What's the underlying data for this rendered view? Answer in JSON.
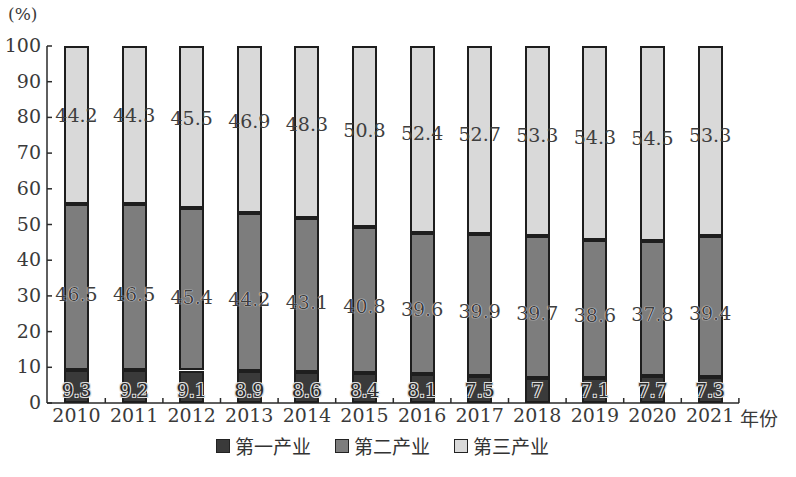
{
  "chart_data": {
    "type": "bar",
    "stacked": true,
    "title": "",
    "ylabel": "(%)",
    "xlabel": "年份",
    "ylim": [
      0,
      100
    ],
    "yticks": [
      0,
      10,
      20,
      30,
      40,
      50,
      60,
      70,
      80,
      90,
      100
    ],
    "grid": false,
    "legend_position": "bottom",
    "categories": [
      "2010",
      "2011",
      "2012",
      "2013",
      "2014",
      "2015",
      "2016",
      "2017",
      "2018",
      "2019",
      "2020",
      "2021"
    ],
    "series": [
      {
        "name": "第一产业",
        "color": "#3a3a3a",
        "values": [
          9.3,
          9.2,
          9.1,
          8.9,
          8.6,
          8.4,
          8.1,
          7.5,
          7,
          7.1,
          7.7,
          7.3
        ]
      },
      {
        "name": "第二产业",
        "color": "#7d7d7d",
        "values": [
          46.5,
          46.5,
          45.4,
          44.2,
          43.1,
          40.8,
          39.6,
          39.9,
          39.7,
          38.6,
          37.8,
          39.4
        ]
      },
      {
        "name": "第三产业",
        "color": "#d9d9d9",
        "values": [
          44.2,
          44.3,
          45.5,
          46.9,
          48.3,
          50.8,
          52.4,
          52.7,
          53.3,
          54.3,
          54.5,
          53.3
        ]
      }
    ],
    "value_labels": {
      "第一产业": [
        "9.3",
        "9.2",
        "9.1",
        "8.9",
        "8.6",
        "8.4",
        "8.1",
        "7.5",
        "7",
        "7.1",
        "7.7",
        "7.3"
      ],
      "第二产业": [
        "46.5",
        "46.5",
        "45.4",
        "44.2",
        "43.1",
        "40.8",
        "39.6",
        "39.9",
        "39.7",
        "38.6",
        "37.8",
        "39.4"
      ],
      "第三产业": [
        "44.2",
        "44.3",
        "45.5",
        "46.9",
        "48.3",
        "50.8",
        "52.4",
        "52.7",
        "53.3",
        "54.3",
        "54.5",
        "53.3"
      ]
    }
  },
  "axis": {
    "y_unit": "(%)",
    "x_unit": "年份"
  },
  "legend": {
    "items": [
      {
        "label": "第一产业",
        "color": "#3a3a3a"
      },
      {
        "label": "第二产业",
        "color": "#7d7d7d"
      },
      {
        "label": "第三产业",
        "color": "#d9d9d9"
      }
    ]
  }
}
